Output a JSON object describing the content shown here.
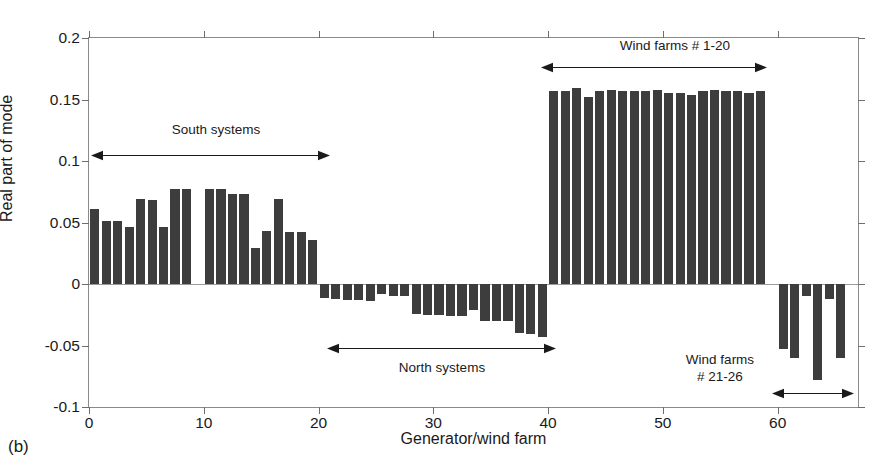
{
  "figure": {
    "panel_label": "(b)",
    "xlabel": "Generator/wind farm",
    "ylabel": "Real part of mode"
  },
  "annotations": {
    "south": "South systems",
    "north": "North systems",
    "wf_1_20": "Wind farms # 1-20",
    "wf_21_26": "Wind farms\n# 21-26"
  },
  "chart_data": {
    "type": "bar",
    "title": "",
    "xlabel": "Generator/wind farm",
    "ylabel": "Real part of mode",
    "xlim": [
      0,
      67
    ],
    "ylim": [
      -0.1,
      0.2
    ],
    "yticks": [
      -0.1,
      -0.05,
      0,
      0.05,
      0.1,
      0.15,
      0.2
    ],
    "ytick_labels": [
      "-0.1",
      "-0.05",
      "0",
      "0.05",
      "0.1",
      "0.15",
      "0.2"
    ],
    "xticks": [
      0,
      10,
      20,
      30,
      40,
      50,
      60
    ],
    "xtick_labels": [
      "0",
      "10",
      "20",
      "30",
      "40",
      "50",
      "60"
    ],
    "grid": false,
    "legend": false,
    "bar_color": "#3d3d3d",
    "x": [
      1,
      2,
      3,
      4,
      5,
      6,
      7,
      8,
      9,
      10,
      11,
      12,
      13,
      14,
      15,
      16,
      17,
      18,
      19,
      20,
      21,
      22,
      23,
      24,
      25,
      26,
      27,
      28,
      29,
      30,
      31,
      32,
      33,
      34,
      35,
      36,
      37,
      38,
      39,
      40,
      41,
      42,
      43,
      44,
      45,
      46,
      47,
      48,
      49,
      50,
      51,
      52,
      53,
      54,
      55,
      56,
      57,
      58,
      59,
      60,
      61,
      62,
      63,
      64,
      65,
      66
    ],
    "values": [
      0.061,
      0.051,
      0.051,
      0.046,
      0.069,
      0.068,
      0.046,
      0.077,
      0.077,
      0.0,
      0.077,
      0.077,
      0.073,
      0.073,
      0.029,
      0.043,
      0.069,
      0.042,
      0.042,
      0.036,
      -0.011,
      -0.012,
      -0.013,
      -0.013,
      -0.014,
      -0.008,
      -0.01,
      -0.01,
      -0.024,
      -0.025,
      -0.025,
      -0.026,
      -0.026,
      -0.021,
      -0.03,
      -0.03,
      -0.03,
      -0.04,
      -0.041,
      -0.043,
      0.157,
      0.157,
      0.159,
      0.152,
      0.157,
      0.158,
      0.157,
      0.157,
      0.157,
      0.158,
      0.155,
      0.155,
      0.154,
      0.157,
      0.158,
      0.157,
      0.157,
      0.155,
      0.157,
      0.0,
      -0.053,
      -0.06,
      -0.01,
      -0.078,
      -0.012,
      -0.06
    ],
    "groups": [
      {
        "label": "South systems",
        "x_from": 1,
        "x_to": 20
      },
      {
        "label": "North systems",
        "x_from": 21,
        "x_to": 40
      },
      {
        "label": "Wind farms # 1-20",
        "x_from": 41,
        "x_to": 59
      },
      {
        "label": "Wind farms # 21-26",
        "x_from": 60,
        "x_to": 66
      }
    ]
  }
}
